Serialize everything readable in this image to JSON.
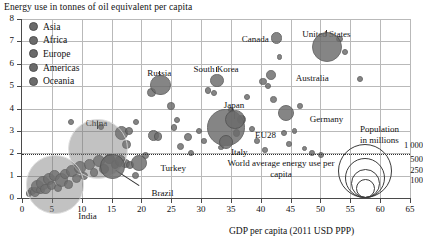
{
  "chart_data": {
    "type": "scatter",
    "title": "Energy use in tonnes of oil equivalent per capita",
    "xlabel": "GDP per capita (2011 USD PPP)",
    "ylabel": "Energy use in tonnes of oil equivalent per capita",
    "xlim": [
      0,
      65
    ],
    "ylim": [
      0,
      8
    ],
    "xticks": [
      "0",
      "5",
      "10",
      "15",
      "20",
      "25",
      "30",
      "35",
      "40",
      "45",
      "50",
      "55",
      "60",
      "65"
    ],
    "yticks": [
      "0",
      "1",
      "2",
      "3",
      "4",
      "5",
      "6",
      "7",
      "8"
    ],
    "grid": true,
    "legend_position": "top-left",
    "size_encoding": "Population in millions",
    "annotation_line": {
      "label": "World average energy use per capita",
      "y_value": 1.93,
      "style": "dotted"
    },
    "series": [
      {
        "name": "Asia",
        "color": "#6b6b6b"
      },
      {
        "name": "Africa",
        "color": "#6b6b6b"
      },
      {
        "name": "Europe",
        "color": "#6b6b6b"
      },
      {
        "name": "Americas",
        "color": "#6b6b6b"
      },
      {
        "name": "Oceania",
        "color": "#6b6b6b"
      }
    ],
    "labeled_points": [
      {
        "name": "United States",
        "x": 51.0,
        "y": 6.8,
        "size": 320,
        "label_dx": 0,
        "label_dy": -17
      },
      {
        "name": "Canada",
        "x": 42.5,
        "y": 7.2,
        "size": 36,
        "label_dx": -34,
        "label_dy": -3
      },
      {
        "name": "Russia",
        "x": 23.0,
        "y": 5.1,
        "size": 144,
        "label_dx": 0,
        "label_dy": -16
      },
      {
        "name": "South Korea",
        "x": 32.5,
        "y": 5.3,
        "size": 51,
        "label_dx": 0,
        "label_dy": -15
      },
      {
        "name": "Australia",
        "x": 41.5,
        "y": 5.55,
        "size": 24,
        "label_dx": 26,
        "label_dy": -1
      },
      {
        "name": "Japan",
        "x": 35.5,
        "y": 3.55,
        "size": 127,
        "label_dx": 0,
        "label_dy": -19
      },
      {
        "name": "Germany",
        "x": 44.0,
        "y": 3.85,
        "size": 82,
        "label_dx": 25,
        "label_dy": 2
      },
      {
        "name": "EU28",
        "x": 34.0,
        "y": 3.2,
        "size": 508,
        "label_dx": 30,
        "label_dy": 4
      },
      {
        "name": "Italy",
        "x": 34.0,
        "y": 2.55,
        "size": 60,
        "label_dx": 6,
        "label_dy": 6
      },
      {
        "name": "China",
        "x": 12.5,
        "y": 2.25,
        "size": 1380,
        "label_dx": 0,
        "label_dy": -30
      },
      {
        "name": "India",
        "x": 5.4,
        "y": 0.65,
        "size": 1310,
        "label_dx": 24,
        "label_dy": 28
      },
      {
        "name": "Turkey",
        "x": 19.5,
        "y": 1.6,
        "size": 79,
        "label_dx": 22,
        "label_dy": 1
      },
      {
        "name": "Brazil",
        "x": 15.0,
        "y": 1.45,
        "size": 207,
        "label_dx": 40,
        "label_dy": 22
      }
    ],
    "size_legend": {
      "title_line1": "Population",
      "title_line2": "in millions",
      "values": [
        "1 000",
        "500",
        "250",
        "100"
      ]
    },
    "points": [
      {
        "x": 1.0,
        "y": 0.25,
        "r": 2.2
      },
      {
        "x": 1.5,
        "y": 0.35,
        "r": 3.0
      },
      {
        "x": 2.0,
        "y": 0.3,
        "r": 4.0
      },
      {
        "x": 2.4,
        "y": 0.55,
        "r": 5.2
      },
      {
        "x": 2.9,
        "y": 0.4,
        "r": 3.4
      },
      {
        "x": 3.3,
        "y": 0.7,
        "r": 6.0
      },
      {
        "x": 3.8,
        "y": 0.45,
        "r": 4.4
      },
      {
        "x": 4.3,
        "y": 0.9,
        "r": 5.0
      },
      {
        "x": 4.8,
        "y": 0.6,
        "r": 3.6
      },
      {
        "x": 5.3,
        "y": 1.05,
        "r": 4.2
      },
      {
        "x": 5.9,
        "y": 0.5,
        "r": 3.0
      },
      {
        "x": 6.4,
        "y": 0.85,
        "r": 5.6
      },
      {
        "x": 7.0,
        "y": 1.1,
        "r": 4.0
      },
      {
        "x": 7.6,
        "y": 0.65,
        "r": 3.2
      },
      {
        "x": 8.2,
        "y": 1.25,
        "r": 4.8
      },
      {
        "x": 8.9,
        "y": 0.9,
        "r": 3.6
      },
      {
        "x": 9.6,
        "y": 1.4,
        "r": 5.2
      },
      {
        "x": 10.3,
        "y": 1.05,
        "r": 3.0
      },
      {
        "x": 11.1,
        "y": 1.55,
        "r": 4.4
      },
      {
        "x": 11.9,
        "y": 1.2,
        "r": 3.4
      },
      {
        "x": 12.8,
        "y": 1.7,
        "r": 5.0
      },
      {
        "x": 13.6,
        "y": 1.35,
        "r": 3.8
      },
      {
        "x": 14.5,
        "y": 1.8,
        "r": 4.2
      },
      {
        "x": 15.4,
        "y": 1.55,
        "r": 3.2
      },
      {
        "x": 16.3,
        "y": 1.7,
        "r": 4.6
      },
      {
        "x": 17.2,
        "y": 1.6,
        "r": 3.6
      },
      {
        "x": 18.0,
        "y": 1.5,
        "r": 3.0
      },
      {
        "x": 18.8,
        "y": 1.05,
        "r": 2.6
      },
      {
        "x": 20.5,
        "y": 1.95,
        "r": 2.6
      },
      {
        "x": 21.5,
        "y": 4.75,
        "r": 3.4
      },
      {
        "x": 16.5,
        "y": 2.95,
        "r": 5.6
      },
      {
        "x": 17.8,
        "y": 3.05,
        "r": 3.2
      },
      {
        "x": 17.4,
        "y": 2.45,
        "r": 3.6
      },
      {
        "x": 21.8,
        "y": 2.85,
        "r": 4.4
      },
      {
        "x": 22.6,
        "y": 2.8,
        "r": 3.2
      },
      {
        "x": 24.8,
        "y": 4.15,
        "r": 2.8
      },
      {
        "x": 25.3,
        "y": 3.2,
        "r": 2.2
      },
      {
        "x": 26.4,
        "y": 2.35,
        "r": 2.6
      },
      {
        "x": 27.6,
        "y": 2.75,
        "r": 3.0
      },
      {
        "x": 28.2,
        "y": 2.05,
        "r": 2.0
      },
      {
        "x": 29.5,
        "y": 3.05,
        "r": 2.2
      },
      {
        "x": 30.3,
        "y": 2.6,
        "r": 1.8
      },
      {
        "x": 31.0,
        "y": 4.85,
        "r": 2.4
      },
      {
        "x": 32.0,
        "y": 4.75,
        "r": 2.0
      },
      {
        "x": 33.2,
        "y": 2.3,
        "r": 1.8
      },
      {
        "x": 34.8,
        "y": 4.0,
        "r": 2.0
      },
      {
        "x": 35.8,
        "y": 2.95,
        "r": 2.6
      },
      {
        "x": 36.6,
        "y": 3.55,
        "r": 3.4
      },
      {
        "x": 37.5,
        "y": 4.55,
        "r": 2.2
      },
      {
        "x": 38.4,
        "y": 3.15,
        "r": 2.0
      },
      {
        "x": 39.2,
        "y": 2.6,
        "r": 1.8
      },
      {
        "x": 40.2,
        "y": 5.25,
        "r": 2.6
      },
      {
        "x": 41.0,
        "y": 5.05,
        "r": 2.0
      },
      {
        "x": 42.0,
        "y": 4.45,
        "r": 2.4
      },
      {
        "x": 43.0,
        "y": 6.35,
        "r": 1.8
      },
      {
        "x": 43.8,
        "y": 2.95,
        "r": 2.0
      },
      {
        "x": 44.6,
        "y": 2.45,
        "r": 1.8
      },
      {
        "x": 45.5,
        "y": 3.05,
        "r": 1.8
      },
      {
        "x": 46.4,
        "y": 4.15,
        "r": 1.8
      },
      {
        "x": 47.2,
        "y": 2.25,
        "r": 1.6
      },
      {
        "x": 48.4,
        "y": 2.05,
        "r": 1.8
      },
      {
        "x": 50.0,
        "y": 1.95,
        "r": 2.0
      },
      {
        "x": 53.0,
        "y": 7.15,
        "r": 2.2
      },
      {
        "x": 54.0,
        "y": 6.55,
        "r": 2.0
      },
      {
        "x": 56.5,
        "y": 5.35,
        "r": 2.2
      },
      {
        "x": 19.0,
        "y": 3.45,
        "r": 2.0
      },
      {
        "x": 25.8,
        "y": 3.55,
        "r": 2.0
      },
      {
        "x": 13.0,
        "y": 3.2,
        "r": 2.0
      },
      {
        "x": 8.0,
        "y": 3.45,
        "r": 2.0
      },
      {
        "x": 40.5,
        "y": 2.2,
        "r": 1.8
      }
    ]
  }
}
